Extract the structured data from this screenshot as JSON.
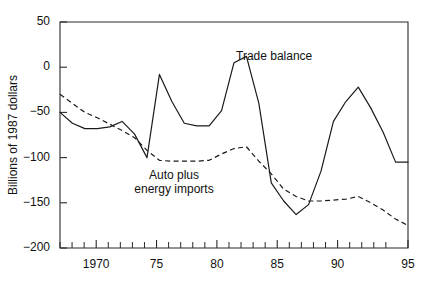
{
  "chart_data": {
    "type": "line",
    "title": "",
    "subtitle": "",
    "xlabel": "",
    "ylabel": "Billions of 1987 dollars",
    "xlim": [
      1967,
      1995
    ],
    "ylim": [
      -200,
      50
    ],
    "grid": false,
    "legend_position": "inline-annotations",
    "y_ticks": [
      50,
      0,
      -50,
      -100,
      -150,
      -200
    ],
    "y_tick_labels": [
      "50",
      "0",
      "−50",
      "−100",
      "−150",
      "−200"
    ],
    "x_ticks": [
      1967,
      1968,
      1969,
      1970,
      1971,
      1972,
      1973,
      1974,
      1975,
      1976,
      1977,
      1978,
      1979,
      1980,
      1981,
      1982,
      1983,
      1984,
      1985,
      1986,
      1987,
      1988,
      1989,
      1990,
      1991,
      1992,
      1993,
      1994,
      1995
    ],
    "x_tick_labels_major": [
      {
        "x": 1970,
        "label": "1970"
      },
      {
        "x": 1975,
        "label": "75"
      },
      {
        "x": 1980,
        "label": "80"
      },
      {
        "x": 1985,
        "label": "85"
      },
      {
        "x": 1990,
        "label": "90"
      },
      {
        "x": 1995,
        "label": "95"
      }
    ],
    "x": [
      1967,
      1968,
      1969,
      1970,
      1971,
      1972,
      1973,
      1974,
      1975,
      1976,
      1977,
      1978,
      1979,
      1980,
      1981,
      1982,
      1983,
      1984,
      1985,
      1986,
      1987,
      1988,
      1989,
      1990,
      1991,
      1992,
      1993,
      1994,
      1995
    ],
    "series": [
      {
        "name": "Trade balance",
        "style": "solid",
        "color": "#1a1a1a",
        "annotation": "Trade balance",
        "values": [
          -50,
          -62,
          -68,
          -68,
          -66,
          -60,
          -74,
          -100,
          -8,
          -38,
          -62,
          -65,
          -65,
          -48,
          5,
          12,
          -40,
          -128,
          -148,
          -163,
          -152,
          -115,
          -60,
          -38,
          -22,
          -45,
          -72,
          -105,
          -105
        ]
      },
      {
        "name": "Auto plus energy imports",
        "style": "dashed",
        "color": "#1a1a1a",
        "annotation": "Auto plus\nenergy imports",
        "values": [
          -30,
          -40,
          -50,
          -56,
          -63,
          -70,
          -78,
          -92,
          -103,
          -104,
          -104,
          -104,
          -103,
          -96,
          -90,
          -88,
          -104,
          -118,
          -135,
          -143,
          -148,
          -148,
          -147,
          -146,
          -143,
          -150,
          -158,
          -168,
          -175
        ]
      }
    ],
    "annotations": [
      {
        "text": "Trade balance",
        "x_data": 1983.5,
        "y_data": 18,
        "align": "start"
      },
      {
        "text": "Auto plus",
        "x_data": 1975.6,
        "y_data": -118,
        "align": "middle"
      },
      {
        "text": "energy imports",
        "x_data": 1975.6,
        "y_data": -131,
        "align": "middle"
      }
    ]
  },
  "axis": {
    "y_label": "Billions of 1987 dollars",
    "y_tick_50": "50",
    "y_tick_0": "0",
    "y_tick_m50": "−50",
    "y_tick_m100": "−100",
    "y_tick_m150": "−150",
    "y_tick_m200": "−200",
    "x_tick_1970": "1970",
    "x_tick_75": "75",
    "x_tick_80": "80",
    "x_tick_85": "85",
    "x_tick_90": "90",
    "x_tick_95": "95"
  },
  "labels": {
    "trade_balance": "Trade balance",
    "auto_line1": "Auto plus",
    "auto_line2": "energy imports"
  }
}
